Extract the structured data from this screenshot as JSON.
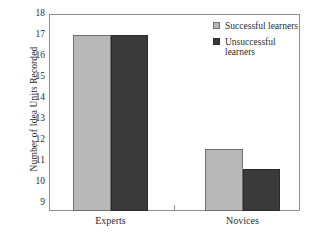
{
  "chart_data": {
    "type": "bar",
    "title": "",
    "xlabel": "",
    "ylabel": "Number of Idea Units Recorded",
    "categories": [
      "Experts",
      "Novices"
    ],
    "series": [
      {
        "name": "Successful learners",
        "color": "#b8b8b8",
        "values": [
          17.0,
          11.55
        ]
      },
      {
        "name": "Unsuccessful learners",
        "color": "#3a3a3a",
        "values": [
          17.0,
          10.6
        ]
      }
    ],
    "ylim": [
      8.6,
      18
    ],
    "yticks": [
      9,
      10,
      11,
      12,
      13,
      14,
      15,
      16,
      17,
      18
    ],
    "ytick_labels": [
      "9",
      "10",
      "11",
      "12",
      "13",
      "14",
      "15",
      "16",
      "17",
      "18"
    ],
    "grid": false,
    "legend_position": "top-right"
  },
  "legend": {
    "entries": [
      {
        "label": "Successful learners",
        "swatch": "light-gray-swatch"
      },
      {
        "label": "Unsuccessful learners",
        "swatch": "dark-gray-swatch"
      }
    ]
  },
  "axes": {
    "y_title": "Number of Idea Units Recorded",
    "x_categories": [
      "Experts",
      "Novices"
    ]
  }
}
